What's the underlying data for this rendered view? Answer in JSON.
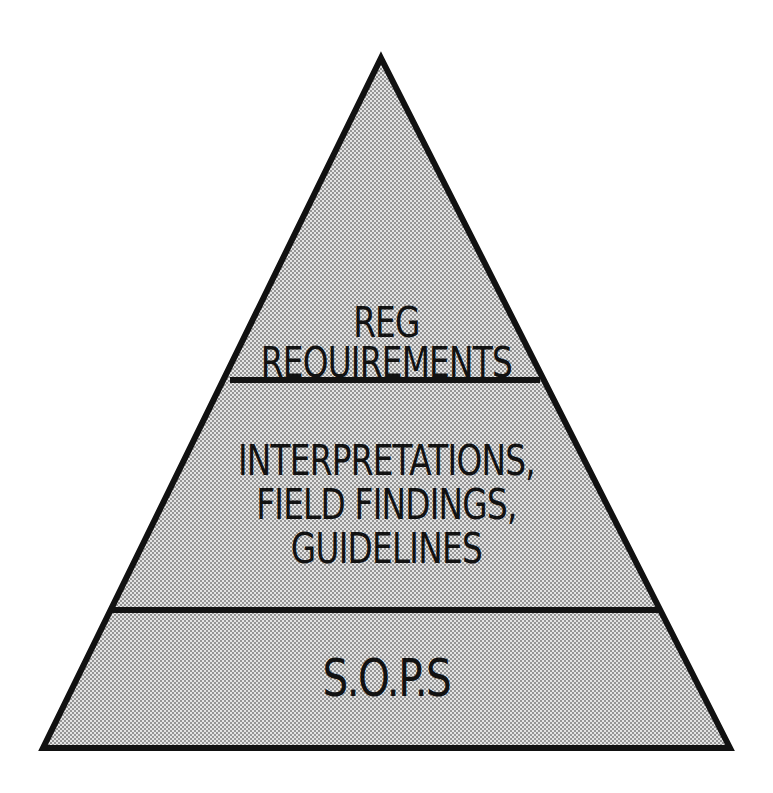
{
  "diagram": {
    "type": "pyramid",
    "tiers": [
      {
        "id": "top",
        "lines": [
          "REG",
          "REQUIREMENTS"
        ]
      },
      {
        "id": "middle",
        "lines": [
          "INTERPRETATIONS,",
          "FIELD FINDINGS,",
          "GUIDELINES"
        ]
      },
      {
        "id": "bottom",
        "lines": [
          "S.O.P.s"
        ]
      }
    ],
    "colors": {
      "outline": "#111111",
      "fill": "#d6d6d6",
      "dot": "#8a8a8a",
      "background": "#ffffff"
    }
  }
}
